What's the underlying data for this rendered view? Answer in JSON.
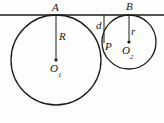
{
  "figure": {
    "kind": "geometry-diagram",
    "width": 164,
    "height": 123,
    "stroke_color": "#1a1a1a",
    "fill_color": "#ffffff",
    "background_color": "#fdfdfc"
  },
  "labels": {
    "point_A": "A",
    "point_B": "B",
    "radius_big": "R",
    "radius_small": "r",
    "distance_d": "d",
    "point_P": "P",
    "center_big": "O",
    "center_big_sub": "1",
    "center_small": "O",
    "center_small_sub": "2"
  },
  "geometry": {
    "tangent_line": {
      "x1": 0,
      "y1": 15,
      "x2": 164,
      "y2": 15
    },
    "circle_big": {
      "cx": 56,
      "cy": 60,
      "r": 45,
      "tangent_point": {
        "x": 56,
        "y": 15
      }
    },
    "circle_small": {
      "cx": 129,
      "cy": 42,
      "r": 27,
      "tangent_point": {
        "x": 129,
        "y": 15
      }
    },
    "radius_segment_big": {
      "x1": 56,
      "y1": 15,
      "x2": 56,
      "y2": 60
    },
    "radius_segment_small": {
      "x1": 129,
      "y1": 15,
      "x2": 129,
      "y2": 42
    },
    "segment_d": {
      "x1": 104,
      "y1": 15,
      "x2": 104,
      "y2": 43
    },
    "point_P_coords": {
      "x": 104,
      "y": 43
    },
    "center_dot_big": {
      "cx": 56,
      "cy": 60,
      "r": 1.6
    },
    "center_dot_small": {
      "cx": 129,
      "cy": 42,
      "r": 1.6
    }
  }
}
